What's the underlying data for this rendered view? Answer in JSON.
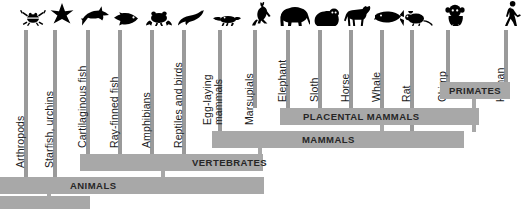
{
  "figure": {
    "type": "cladogram",
    "title": "",
    "accent_bar_color": "#a8a8a8",
    "stem_color": "#9a9a9a",
    "silhouette_color": "#000000",
    "background_color": "#ffffff"
  },
  "taxa": [
    {
      "label": "Arthropods",
      "icon": "crab-icon",
      "x": 18,
      "stem_x": 24,
      "stem_top": 30,
      "stem_bottom": 178,
      "label_x": 14,
      "label_y": 168,
      "lines": 1
    },
    {
      "label": "Starfish, urchins",
      "icon": "starfish-icon",
      "x": 47,
      "stem_x": 53,
      "stem_top": 30,
      "stem_bottom": 178,
      "label_x": 43,
      "label_y": 168,
      "lines": 1
    },
    {
      "label": "Cartilaginous fish",
      "icon": "shark-icon",
      "x": 80,
      "stem_x": 86,
      "stem_top": 30,
      "stem_bottom": 155,
      "label_x": 76,
      "label_y": 148,
      "lines": 1
    },
    {
      "label": "Ray-finned fish",
      "icon": "fish-icon",
      "x": 112,
      "stem_x": 118,
      "stem_top": 30,
      "stem_bottom": 155,
      "label_x": 108,
      "label_y": 148,
      "lines": 1
    },
    {
      "label": "Amphibians",
      "icon": "frog-icon",
      "x": 144,
      "stem_x": 150,
      "stem_top": 30,
      "stem_bottom": 155,
      "label_x": 140,
      "label_y": 148,
      "lines": 1
    },
    {
      "label": "Reptiles and birds",
      "icon": "bird-icon",
      "x": 176,
      "stem_x": 182,
      "stem_top": 30,
      "stem_bottom": 155,
      "label_x": 172,
      "label_y": 148,
      "lines": 1
    },
    {
      "label": "Egg-laying\nmammals",
      "icon": "platypus-icon",
      "x": 212,
      "stem_x": 218,
      "stem_top": 30,
      "stem_bottom": 132,
      "label_x": 202,
      "label_y": 125,
      "lines": 2
    },
    {
      "label": "Marsupials",
      "icon": "kangaroo-icon",
      "x": 247,
      "stem_x": 253,
      "stem_top": 30,
      "stem_bottom": 108,
      "label_x": 243,
      "label_y": 125,
      "lines": 1
    },
    {
      "label": "Elephant",
      "icon": "elephant-icon",
      "x": 280,
      "stem_x": 286,
      "stem_top": 30,
      "stem_bottom": 108,
      "label_x": 276,
      "label_y": 102,
      "lines": 1
    },
    {
      "label": "Sloth",
      "icon": "sloth-icon",
      "x": 312,
      "stem_x": 318,
      "stem_top": 30,
      "stem_bottom": 108,
      "label_x": 308,
      "label_y": 102,
      "lines": 1
    },
    {
      "label": "Horse",
      "icon": "horse-icon",
      "x": 343,
      "stem_x": 349,
      "stem_top": 30,
      "stem_bottom": 108,
      "label_x": 339,
      "label_y": 102,
      "lines": 1
    },
    {
      "label": "Whale",
      "icon": "whale-icon",
      "x": 374,
      "stem_x": 380,
      "stem_top": 30,
      "stem_bottom": 108,
      "label_x": 370,
      "label_y": 102,
      "lines": 1
    },
    {
      "label": "Rat",
      "icon": "rat-icon",
      "x": 404,
      "stem_x": 410,
      "stem_top": 30,
      "stem_bottom": 132,
      "label_x": 400,
      "label_y": 102,
      "lines": 1
    },
    {
      "label": "Chimp",
      "icon": "chimp-icon",
      "x": 440,
      "stem_x": 446,
      "stem_top": 30,
      "stem_bottom": 95,
      "label_x": 436,
      "label_y": 102,
      "lines": 1
    },
    {
      "label": "Human",
      "icon": "human-icon",
      "x": 498,
      "stem_x": 504,
      "stem_top": 30,
      "stem_bottom": 95,
      "label_x": 494,
      "label_y": 102,
      "lines": 1
    }
  ],
  "clades": [
    {
      "name": "PRIMATES",
      "x": 440,
      "y": 82,
      "w": 70,
      "h": 17,
      "label_x": 9,
      "stem_x": 472,
      "stem_bottom": 132
    },
    {
      "name": "PLACENTAL MAMMALS",
      "x": 280,
      "y": 108,
      "w": 199,
      "h": 17,
      "label_x": 23,
      "stem_x": 380,
      "stem_bottom": 132
    },
    {
      "name": "MAMMALS",
      "x": 212,
      "y": 131,
      "w": 252,
      "h": 17,
      "label_x": 90,
      "stem_x": 258,
      "stem_bottom": 155
    },
    {
      "name": "VERTEBRATES",
      "x": 80,
      "y": 154,
      "w": 183,
      "h": 17,
      "label_x": 112,
      "stem_x": 161,
      "stem_bottom": 178
    },
    {
      "name": "ANIMALS",
      "x": 0,
      "y": 177,
      "w": 264,
      "h": 17,
      "label_x": 70,
      "stem_x": 47,
      "stem_bottom": 201
    },
    {
      "name": "",
      "x": 0,
      "y": 196,
      "w": 90,
      "h": 13,
      "label_x": 0,
      "stem_x": -1,
      "stem_bottom": 0
    }
  ]
}
